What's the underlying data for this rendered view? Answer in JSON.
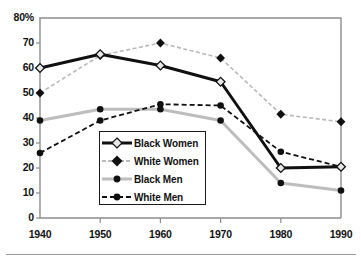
{
  "chart": {
    "type": "line",
    "title": "",
    "subtitle": "",
    "xlabel": "",
    "ylabel": "",
    "top_axis_label": "80%",
    "y_ticks": [
      "80%",
      "70",
      "60",
      "50",
      "40",
      "30",
      "20",
      "10",
      "0"
    ],
    "y_tick_values": [
      80,
      70,
      60,
      50,
      40,
      30,
      20,
      10,
      0
    ],
    "x_ticks": [
      "1940",
      "1950",
      "1960",
      "1970",
      "1980",
      "1990"
    ],
    "ylim": [
      0,
      80
    ],
    "grid": false,
    "legend_position": "center-left-inside"
  },
  "chart_data": {
    "type": "line",
    "title": "",
    "xlabel": "",
    "ylabel": "",
    "ylim": [
      0,
      80
    ],
    "grid": false,
    "legend_position": "center-left-inside",
    "categories": [
      1940,
      1950,
      1960,
      1970,
      1980,
      1990
    ],
    "tick_labels": {
      "x": [
        "1940",
        "1950",
        "1960",
        "1970",
        "1980",
        "1990"
      ],
      "y": [
        "0",
        "10",
        "20",
        "30",
        "40",
        "50",
        "60",
        "70",
        "80%"
      ]
    },
    "series": [
      {
        "name": "Black Women",
        "values": [
          60,
          65.5,
          61,
          54.5,
          20,
          20.5
        ],
        "color": "#101010",
        "line_style": "solid",
        "line_width": 3,
        "marker": "diamond-open",
        "marker_fill": "#e8e8e8"
      },
      {
        "name": "White Women",
        "values": [
          50,
          65,
          70,
          64,
          41.5,
          38.5
        ],
        "color": "#b9b9b9",
        "line_style": "dashed",
        "line_width": 1.6,
        "marker": "diamond-filled",
        "marker_fill": "#101010"
      },
      {
        "name": "Black Men",
        "values": [
          39,
          43.5,
          43.5,
          39,
          14,
          11
        ],
        "color": "#bdbdbd",
        "line_style": "solid",
        "line_width": 3,
        "marker": "circle-filled",
        "marker_fill": "#101010"
      },
      {
        "name": "White Men",
        "values": [
          26,
          39,
          45.5,
          45,
          26.5,
          20.5
        ],
        "color": "#101010",
        "line_style": "dashed",
        "line_width": 1.8,
        "marker": "circle-filled",
        "marker_fill": "#101010"
      }
    ]
  },
  "legend": {
    "entries": [
      {
        "label": "Black Women"
      },
      {
        "label": "White Women"
      },
      {
        "label": "Black Men"
      },
      {
        "label": "White Men"
      }
    ]
  },
  "colors": {
    "axis": "#8d8d8d",
    "text": "#111111",
    "dark_series": "#101010",
    "light_series": "#bdbdbd",
    "background": "#ffffff",
    "rule": "#9a9a9a"
  }
}
